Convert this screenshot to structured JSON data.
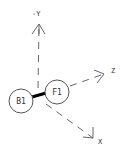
{
  "diagram": {
    "type": "coordinate-frame",
    "nodes": {
      "b1": {
        "label": "B1",
        "cx": 21,
        "cy": 101,
        "r": 12
      },
      "f1": {
        "label": "F1",
        "cx": 57,
        "cy": 92,
        "r": 12
      }
    },
    "link": {
      "from": "B1",
      "to": "F1",
      "style": "thick-solid"
    },
    "axes": {
      "y": {
        "label": "-Y",
        "direction": "up",
        "style": "dashed-arrow"
      },
      "z": {
        "label": "Z",
        "direction": "right-up",
        "style": "dashed-arrow"
      },
      "x": {
        "label": "X",
        "direction": "down-right",
        "style": "dashed-arrow"
      }
    },
    "colors": {
      "stroke": "#555555",
      "link": "#000000",
      "background": "#ffffff"
    }
  }
}
